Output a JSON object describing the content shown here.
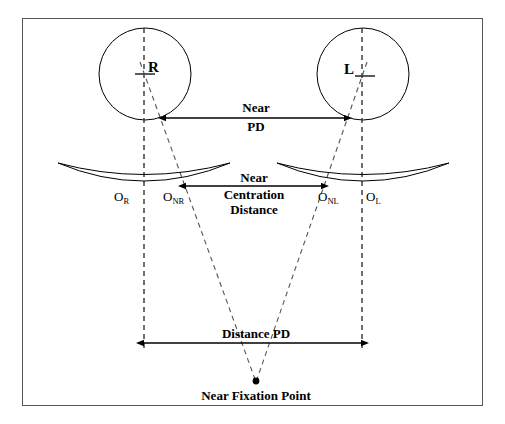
{
  "figure": {
    "type": "optical-diagram",
    "border_color": "#555555",
    "line_color": "#000000",
    "background": "#ffffff"
  },
  "eyes": {
    "right": {
      "label": "R",
      "cx": 145,
      "cy": 74,
      "r": 46
    },
    "left": {
      "label": "L",
      "cx": 363,
      "cy": 74,
      "r": 46
    }
  },
  "lenses": {
    "right": {
      "cx": 144,
      "cy": 178,
      "half_width": 86
    },
    "left": {
      "cx": 363,
      "cy": 178,
      "half_width": 86
    }
  },
  "optical_centres": [
    {
      "name": "O_R",
      "base": "O",
      "sub": "R",
      "x": 122,
      "y": 199
    },
    {
      "name": "O_NR",
      "base": "O",
      "sub": "NR",
      "x": 171,
      "y": 199
    },
    {
      "name": "O_NL",
      "base": "O",
      "sub": "NL",
      "x": 326,
      "y": 199
    },
    {
      "name": "O_L",
      "base": "O",
      "sub": "L",
      "x": 372,
      "y": 199
    }
  ],
  "measurements": {
    "near_pd": {
      "lines": [
        "Near",
        "PD"
      ],
      "x1": 166,
      "x2": 345,
      "y": 118
    },
    "near_centration": {
      "lines": [
        "Near",
        "Centration",
        "Distance"
      ],
      "x1": 186,
      "x2": 322,
      "y": 186
    },
    "distance_pd": {
      "lines": [
        "Distance PD"
      ],
      "x1": 144,
      "x2": 362,
      "y": 343
    }
  },
  "fixation": {
    "label": "Near Fixation Point",
    "point_x": 256,
    "point_y": 382,
    "label_x": 256,
    "label_y": 390
  },
  "axes": {
    "right_visual_axis": {
      "x": 144,
      "y1": 28,
      "y2": 352
    },
    "left_visual_axis": {
      "x": 362,
      "y1": 28,
      "y2": 352
    },
    "right_near_ray": {
      "x1": 140,
      "y1": 60,
      "x2": 256,
      "y2": 382
    },
    "left_near_ray": {
      "x1": 366,
      "y1": 60,
      "x2": 256,
      "y2": 382
    }
  }
}
